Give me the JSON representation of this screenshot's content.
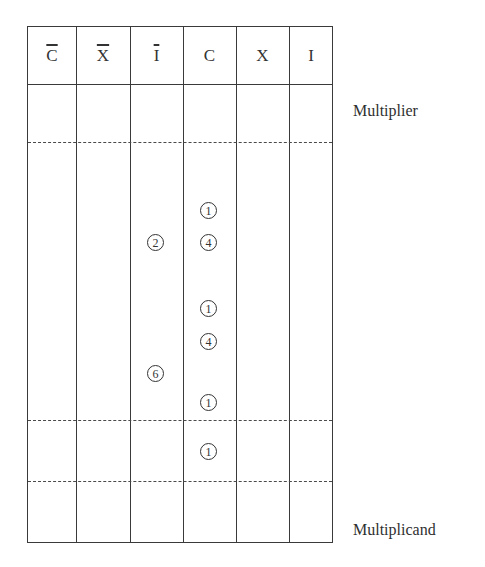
{
  "figure": {
    "columns": [
      {
        "label": "C",
        "overline": true
      },
      {
        "label": "X",
        "overline": true
      },
      {
        "label": "I",
        "overline": true
      },
      {
        "label": "C",
        "overline": false
      },
      {
        "label": "X",
        "overline": false
      },
      {
        "label": "I",
        "overline": false
      }
    ],
    "labels": {
      "multiplier": "Multiplier",
      "multiplicand": "Multiplicand"
    },
    "counters": [
      {
        "column": "C",
        "value": "1",
        "symbol": "①"
      },
      {
        "column": "I-bar",
        "value": "2",
        "symbol": "②"
      },
      {
        "column": "C",
        "value": "4",
        "symbol": "④"
      },
      {
        "column": "C",
        "value": "1",
        "symbol": "①"
      },
      {
        "column": "C",
        "value": "4",
        "symbol": "④"
      },
      {
        "column": "I-bar",
        "value": "6",
        "symbol": "⑥"
      },
      {
        "column": "C",
        "value": "1",
        "symbol": "①"
      },
      {
        "column": "C",
        "value": "1",
        "symbol": "①"
      }
    ]
  }
}
